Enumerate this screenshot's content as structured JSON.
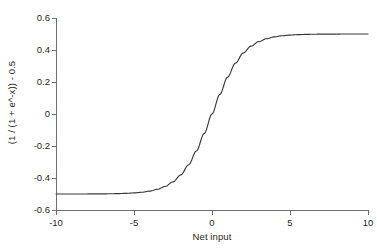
{
  "chart_data": {
    "type": "line",
    "title": "",
    "xlabel": "Net input",
    "ylabel": "(1 / (1 + e^-x)) - 0.5",
    "xlim": [
      -10,
      10
    ],
    "ylim": [
      -0.6,
      0.6
    ],
    "xticks": [
      -10,
      -5,
      0,
      5,
      10
    ],
    "xtick_labels": [
      "-10",
      "-5",
      "0",
      "5",
      "10"
    ],
    "yticks": [
      0.6,
      0.4,
      0.2,
      0,
      -0.2,
      -0.4,
      -0.6
    ],
    "ytick_labels": [
      "0.6",
      "0.4",
      "0.2",
      "0",
      "-0.2",
      "-0.4",
      "-0.6"
    ],
    "grid": false,
    "legend": false,
    "legend_position": "none",
    "line_color": "#3a3a3a",
    "axis_color": "#6e6e6e",
    "background_color": "#ffffff",
    "series": [
      {
        "name": "(1 / (1 + e^-x)) - 0.5",
        "x": [
          -10,
          -9.5,
          -9,
          -8.5,
          -8,
          -7.5,
          -7,
          -6.5,
          -6,
          -5.5,
          -5,
          -4.5,
          -4,
          -3.5,
          -3,
          -2.5,
          -2,
          -1.5,
          -1,
          -0.5,
          0,
          0.5,
          1,
          1.5,
          2,
          2.5,
          3,
          3.5,
          4,
          4.5,
          5,
          5.5,
          6,
          6.5,
          7,
          7.5,
          8,
          8.5,
          9,
          9.5,
          10
        ],
        "y": [
          -0.49995,
          -0.49993,
          -0.49988,
          -0.4998,
          -0.49966,
          -0.49945,
          -0.49909,
          -0.4985,
          -0.49753,
          -0.49592,
          -0.49331,
          -0.48906,
          -0.48201,
          -0.4705,
          -0.45232,
          -0.42424,
          -0.3808,
          -0.31757,
          -0.23105,
          -0.12246,
          0.0,
          0.12246,
          0.23105,
          0.31757,
          0.3808,
          0.42424,
          0.45232,
          0.4705,
          0.48201,
          0.48906,
          0.49331,
          0.49592,
          0.49753,
          0.4985,
          0.49909,
          0.49945,
          0.49966,
          0.4998,
          0.49988,
          0.49993,
          0.49995
        ]
      }
    ]
  }
}
